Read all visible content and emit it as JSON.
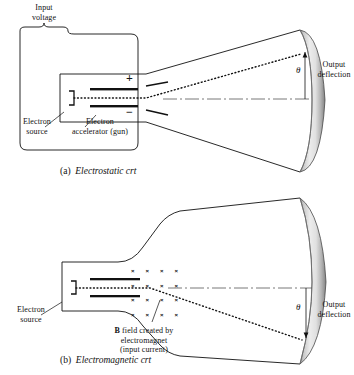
{
  "figure": {
    "background_color": "#ffffff",
    "ink_color": "#111111"
  },
  "diagram_a": {
    "caption_tag": "(a)",
    "caption_text": "Electrostatic crt",
    "labels": {
      "input_voltage": "Input\nvoltage",
      "electron_source": "Electron\nsource",
      "electron_accelerator": "Electron\naccelerator (gun)",
      "output_deflection": "Output\ndeflection",
      "plate_positive": "+",
      "plate_negative": "−",
      "deflection_angle": "θ"
    }
  },
  "diagram_b": {
    "caption_tag": "(b)",
    "caption_text": "Electromagnetic crt",
    "labels": {
      "electron_source": "Electron\nsource",
      "b_field_line1_bold": "B",
      "b_field_line1_rest": " field created by",
      "b_field_line2": "electromagnet",
      "b_field_line3": "(input current)",
      "output_deflection": "Output\ndeflection",
      "deflection_angle": "θ",
      "field_marker": "×"
    },
    "field_grid": {
      "columns": 4,
      "rows": 4,
      "symbol": "×"
    }
  }
}
